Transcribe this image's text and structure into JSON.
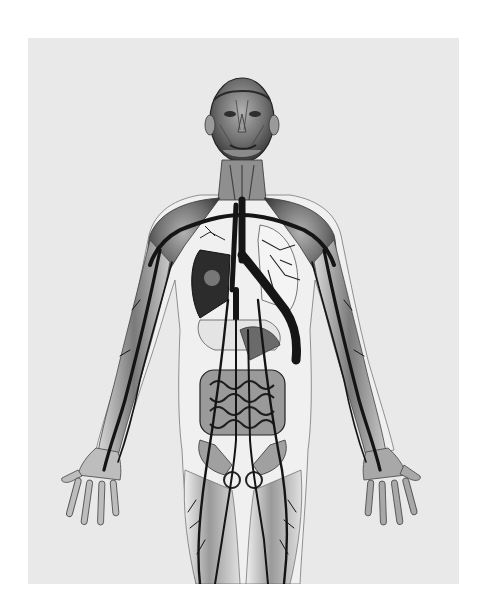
{
  "image": {
    "subject": "anatomical illustration of the human circulatory system",
    "style": "grayscale engraving-style drawing",
    "colors": {
      "page_background": "#ffffff",
      "frame_background": "#e9e9e9",
      "vessel": "#1a1a1a",
      "muscle_dark": "#555555",
      "muscle_mid": "#8a8a8a",
      "skin_light": "#f2f2f2"
    },
    "regions": [
      "head",
      "neck",
      "chest",
      "lungs",
      "heart",
      "stomach",
      "intestines",
      "pelvis",
      "left-arm",
      "right-arm",
      "left-hand",
      "right-hand",
      "thighs"
    ]
  }
}
